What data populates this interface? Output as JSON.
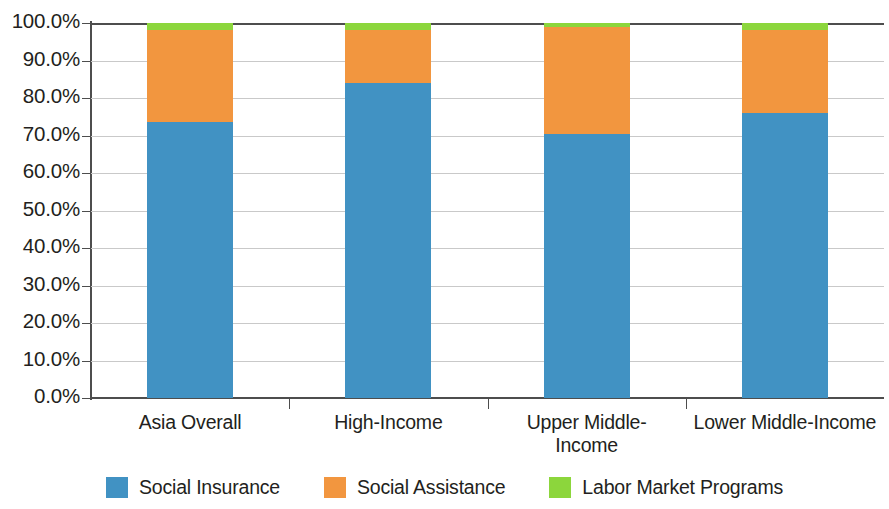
{
  "chart_data": {
    "type": "bar",
    "subtype": "stacked-100-percent",
    "title": "",
    "xlabel": "",
    "ylabel": "",
    "ylim": [
      0,
      100
    ],
    "ytick_labels": [
      "100.0%",
      "90.0%",
      "80.0%",
      "70.0%",
      "60.0%",
      "50.0%",
      "40.0%",
      "30.0%",
      "20.0%",
      "10.0%",
      "0.0%"
    ],
    "ytick_values": [
      100,
      90,
      80,
      70,
      60,
      50,
      40,
      30,
      20,
      10,
      0
    ],
    "grid": true,
    "legend_position": "bottom",
    "categories": [
      "Asia Overall",
      "High-Income",
      "Upper Middle-\nIncome",
      "Lower Middle-Income"
    ],
    "series": [
      {
        "name": "Social Insurance",
        "color": "#4192C3",
        "values": [
          73.5,
          84.0,
          70.3,
          76.0
        ]
      },
      {
        "name": "Social Assistance",
        "color": "#F2963F",
        "values": [
          24.6,
          14.1,
          28.6,
          22.1
        ]
      },
      {
        "name": "Labor Market Programs",
        "color": "#8CD63C",
        "values": [
          1.9,
          1.9,
          1.1,
          1.9
        ]
      }
    ]
  },
  "axis": {
    "y_labels": [
      "100.0%",
      "90.0%",
      "80.0%",
      "70.0%",
      "60.0%",
      "50.0%",
      "40.0%",
      "30.0%",
      "20.0%",
      "10.0%",
      "0.0%"
    ],
    "x_labels": [
      "Asia Overall",
      "High-Income",
      "Upper Middle-\nIncome",
      "Lower Middle-Income"
    ]
  },
  "legend": {
    "items": [
      {
        "label": "Social Insurance",
        "color": "#4192C3"
      },
      {
        "label": "Social Assistance",
        "color": "#F2963F"
      },
      {
        "label": "Labor Market Programs",
        "color": "#8CD63C"
      }
    ]
  }
}
